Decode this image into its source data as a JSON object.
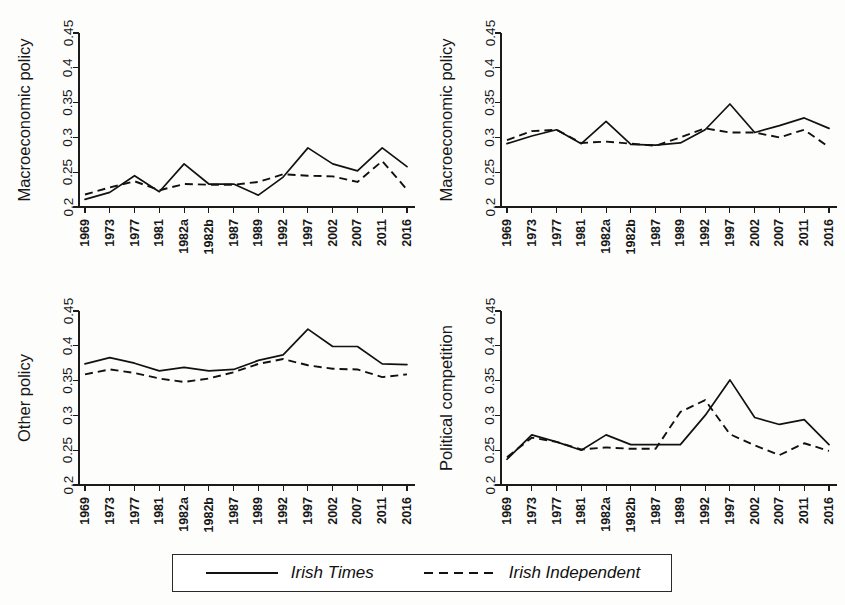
{
  "figure": {
    "title": "",
    "background_color": "#fdfdfc",
    "line_color": "#111111"
  },
  "legend": {
    "entries": [
      {
        "label": "Irish Times",
        "style": "solid",
        "icon": "solid-line-icon"
      },
      {
        "label": "Irish Independent",
        "style": "dashed",
        "icon": "dashed-line-icon"
      }
    ]
  },
  "axis": {
    "y_ticks": [
      "0.2",
      "0.25",
      "0.3",
      "0.35",
      "0.4",
      "0.45"
    ],
    "y_tick_values": [
      0.2,
      0.25,
      0.3,
      0.35,
      0.4,
      0.45
    ],
    "y_min": 0.2,
    "y_max": 0.45,
    "x_ticks": [
      "1969",
      "1973",
      "1977",
      "1981",
      "1982a",
      "1982b",
      "1987",
      "1989",
      "1992",
      "1997",
      "2002",
      "2007",
      "2011",
      "2016"
    ]
  },
  "chart_data": [
    {
      "id": "macro-policy-left",
      "panel": "top-left",
      "type": "line",
      "title": "",
      "xlabel": "",
      "ylabel": "Macroeconomic policy",
      "ylim": [
        0.2,
        0.45
      ],
      "grid": false,
      "legend_position": "bottom",
      "categories": [
        "1969",
        "1973",
        "1977",
        "1981",
        "1982a",
        "1982b",
        "1987",
        "1989",
        "1992",
        "1997",
        "2002",
        "2007",
        "2011",
        "2016"
      ],
      "series": [
        {
          "name": "Irish Times",
          "style": "solid",
          "values": [
            0.211,
            0.221,
            0.245,
            0.222,
            0.262,
            0.233,
            0.233,
            0.217,
            0.243,
            0.285,
            0.262,
            0.252,
            0.285,
            0.258
          ]
        },
        {
          "name": "Irish Independent",
          "style": "dashed",
          "values": [
            0.218,
            0.228,
            0.237,
            0.224,
            0.233,
            0.232,
            0.232,
            0.236,
            0.247,
            0.245,
            0.244,
            0.236,
            0.266,
            0.225
          ]
        }
      ]
    },
    {
      "id": "macro-policy-right",
      "panel": "top-right",
      "type": "line",
      "title": "",
      "xlabel": "",
      "ylabel": "Macroeconomic policy",
      "ylim": [
        0.2,
        0.45
      ],
      "grid": false,
      "legend_position": "bottom",
      "categories": [
        "1969",
        "1973",
        "1977",
        "1981",
        "1982a",
        "1982b",
        "1987",
        "1989",
        "1992",
        "1997",
        "2002",
        "2007",
        "2011",
        "2016"
      ],
      "series": [
        {
          "name": "Irish Times",
          "style": "solid",
          "values": [
            0.291,
            0.302,
            0.311,
            0.291,
            0.323,
            0.29,
            0.289,
            0.292,
            0.311,
            0.348,
            0.307,
            0.317,
            0.328,
            0.313
          ]
        },
        {
          "name": "Irish Independent",
          "style": "dashed",
          "values": [
            0.296,
            0.309,
            0.311,
            0.292,
            0.294,
            0.291,
            0.288,
            0.3,
            0.313,
            0.307,
            0.307,
            0.3,
            0.311,
            0.286
          ]
        }
      ]
    },
    {
      "id": "other-policy",
      "panel": "bottom-left",
      "type": "line",
      "title": "",
      "xlabel": "",
      "ylabel": "Other policy",
      "ylim": [
        0.2,
        0.45
      ],
      "grid": false,
      "legend_position": "bottom",
      "categories": [
        "1969",
        "1973",
        "1977",
        "1981",
        "1982a",
        "1982b",
        "1987",
        "1989",
        "1992",
        "1997",
        "2002",
        "2007",
        "2011",
        "2016"
      ],
      "series": [
        {
          "name": "Irish Times",
          "style": "solid",
          "values": [
            0.374,
            0.383,
            0.375,
            0.364,
            0.369,
            0.364,
            0.366,
            0.379,
            0.387,
            0.424,
            0.399,
            0.399,
            0.374,
            0.373
          ]
        },
        {
          "name": "Irish Independent",
          "style": "dashed",
          "values": [
            0.359,
            0.366,
            0.361,
            0.353,
            0.348,
            0.353,
            0.362,
            0.374,
            0.381,
            0.372,
            0.367,
            0.366,
            0.355,
            0.359
          ]
        }
      ]
    },
    {
      "id": "political-competition",
      "panel": "bottom-right",
      "type": "line",
      "title": "",
      "xlabel": "",
      "ylabel": "Political competition",
      "ylim": [
        0.2,
        0.45
      ],
      "grid": false,
      "legend_position": "bottom",
      "categories": [
        "1969",
        "1973",
        "1977",
        "1981",
        "1982a",
        "1982b",
        "1987",
        "1989",
        "1992",
        "1997",
        "2002",
        "2007",
        "2011",
        "2016"
      ],
      "series": [
        {
          "name": "Irish Times",
          "style": "solid",
          "values": [
            0.237,
            0.272,
            0.262,
            0.25,
            0.272,
            0.258,
            0.258,
            0.258,
            0.3,
            0.351,
            0.297,
            0.287,
            0.294,
            0.258
          ]
        },
        {
          "name": "Irish Independent",
          "style": "dashed",
          "values": [
            0.24,
            0.268,
            0.262,
            0.251,
            0.254,
            0.252,
            0.252,
            0.305,
            0.322,
            0.273,
            0.257,
            0.243,
            0.26,
            0.249
          ]
        }
      ]
    }
  ]
}
